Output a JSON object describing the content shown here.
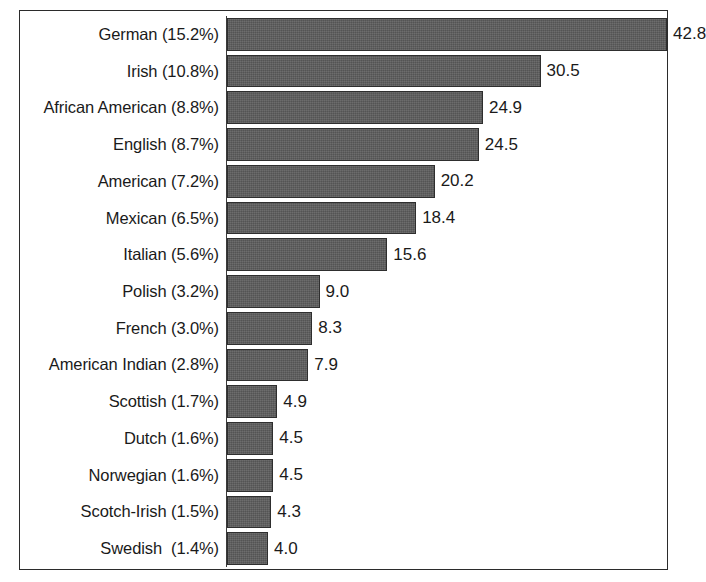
{
  "chart_data": {
    "type": "bar",
    "orientation": "horizontal",
    "title": "",
    "subtitle": "",
    "xlabel": "",
    "ylabel": "",
    "grid": false,
    "legend": null,
    "xlim": [
      0,
      42.8
    ],
    "value_label_format": "one-decimal",
    "bar_color": "#5c5c5c",
    "bar_border_color": "#2e2e2e",
    "background_color": "#ffffff",
    "frame_border_color": "#2b2b2b",
    "text_color": "#1a1a1a",
    "categories": [
      "German (15.2%)",
      "Irish (10.8%)",
      "African American (8.8%)",
      "English (8.7%)",
      "American (7.2%)",
      "Mexican (6.5%)",
      "Italian (5.6%)",
      "Polish (3.2%)",
      "French (3.0%)",
      "American Indian (2.8%)",
      "Scottish (1.7%)",
      "Dutch (1.6%)",
      "Norwegian (1.6%)",
      "Scotch-Irish (1.5%)",
      "Swedish  (1.4%)"
    ],
    "values": [
      42.8,
      30.5,
      24.9,
      24.5,
      20.2,
      18.4,
      15.6,
      9.0,
      8.3,
      7.9,
      4.9,
      4.5,
      4.5,
      4.3,
      4.0
    ],
    "value_labels": [
      "42.8",
      "30.5",
      "24.9",
      "24.5",
      "20.2",
      "18.4",
      "15.6",
      "9.0",
      "8.3",
      "7.9",
      "4.9",
      "4.5",
      "4.5",
      "4.3",
      "4.0"
    ],
    "group_names": [
      "German",
      "Irish",
      "African American",
      "English",
      "American",
      "Mexican",
      "Italian",
      "Polish",
      "French",
      "American Indian",
      "Scottish",
      "Dutch",
      "Norwegian",
      "Scotch-Irish",
      "Swedish"
    ],
    "percent_labels": [
      "15.2%",
      "10.8%",
      "8.8%",
      "8.7%",
      "7.2%",
      "6.5%",
      "5.6%",
      "3.2%",
      "3.0%",
      "2.8%",
      "1.7%",
      "1.6%",
      "1.6%",
      "1.5%",
      "1.4%"
    ]
  }
}
